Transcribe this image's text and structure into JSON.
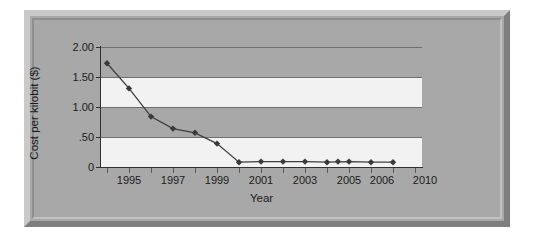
{
  "chart_data": {
    "type": "line",
    "title": "",
    "xlabel": "Year",
    "ylabel": "Cost per kilobit ($)",
    "ylim": [
      0,
      2.0
    ],
    "ytick_labels": [
      "2.00",
      "1.50",
      "1.00",
      ".50",
      "0"
    ],
    "ytick_values": [
      2.0,
      1.5,
      1.0,
      0.5,
      0
    ],
    "grid": true,
    "legend_position": "none",
    "banding": "alternating horizontal bands every 0.50",
    "marker": "diamond",
    "categories": [
      "1994",
      "1995",
      "1996",
      "1997",
      "1998",
      "1999",
      "2000",
      "2001",
      "2002",
      "2003",
      "2004",
      "2005",
      "2006",
      "2010"
    ],
    "xtick_labels_shown": [
      "",
      "1995",
      "",
      "1997",
      "",
      "1999",
      "",
      "2001",
      "",
      "2003",
      "",
      "2005",
      "2006",
      "2010"
    ],
    "values": [
      1.73,
      1.31,
      0.84,
      0.64,
      0.57,
      0.39,
      0.08,
      0.09,
      0.09,
      0.09,
      0.08,
      0.09,
      0.08,
      0.08
    ],
    "series": [
      {
        "name": "Cost per kilobit",
        "values": [
          1.73,
          1.31,
          0.84,
          0.64,
          0.57,
          0.39,
          0.08,
          0.09,
          0.09,
          0.09,
          0.08,
          0.09,
          0.08,
          0.08
        ]
      }
    ],
    "extra_points": [
      {
        "x_index": 10.5,
        "value": 0.09
      }
    ],
    "colors": {
      "line": "#3f3f3f",
      "marker": "#3a3a3a",
      "band_light": "#f2f2f2",
      "band_dark": "#a8a8a8",
      "frame": "#a8a8a8",
      "axis": "#303030",
      "gridline": "#6f6f6f",
      "text": "#1b1b1b",
      "page_background": "#ffffff"
    }
  }
}
